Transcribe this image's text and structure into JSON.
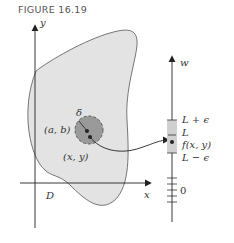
{
  "figure": {
    "title": "FIGURE 16.19"
  },
  "axes_xy": {
    "x_label": "x",
    "y_label": "y",
    "region_label": "D"
  },
  "disk": {
    "radius_label": "δ",
    "center_label": "(a, b)",
    "point_label": "(x, y)"
  },
  "axis_w": {
    "label": "w",
    "upper_bound": "L + ϵ",
    "limit": "L",
    "value": "f(x, y)",
    "lower_bound": "L − ϵ",
    "zero": "0"
  },
  "colors": {
    "region_fill": "#e3e3e3",
    "disk_fill": "#9a9a9a",
    "interval_fill": "#d0d0d0",
    "stroke": "#333333"
  }
}
